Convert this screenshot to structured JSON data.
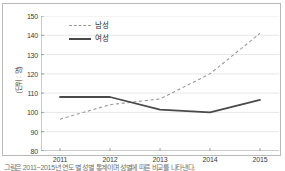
{
  "chart_data": {
    "type": "line",
    "title": "",
    "xlabel": "",
    "ylabel": "(단위 : 명)",
    "categories": [
      "2011",
      "2012",
      "2013",
      "2014",
      "2015"
    ],
    "ylim": [
      80,
      150
    ],
    "yticks": [
      80,
      90,
      100,
      110,
      120,
      130,
      140,
      150
    ],
    "grid": true,
    "legend_position": "top-left",
    "series": [
      {
        "name": "남성",
        "style": "dashed",
        "color": "#9a9a9a",
        "values": [
          96.5,
          104,
          107,
          120,
          141
        ]
      },
      {
        "name": "여성",
        "style": "solid",
        "color": "#4a4a4a",
        "values": [
          108,
          108,
          101.5,
          100,
          106.5
        ]
      }
    ]
  },
  "axis": {
    "y_title": "(단위 : 명)",
    "y_tick_labels": [
      "150",
      "140",
      "130",
      "120",
      "110",
      "100",
      "90",
      "80"
    ],
    "x_tick_labels": [
      "2011",
      "2012",
      "2013",
      "2014",
      "2015"
    ]
  },
  "legend": {
    "items": [
      {
        "label": "남성",
        "swatch": "dashed-line-swatch"
      },
      {
        "label": "여성",
        "swatch": "solid-line-swatch"
      }
    ]
  },
  "caption": {
    "text": "그림은 2011~2015년 연도 별 성별 통계이며 성별에 따른 비교를 나타낸다."
  },
  "colors": {
    "male_line": "#9a9a9a",
    "female_line": "#4a4a4a",
    "grid": "#dcdcdc",
    "axis": "#8c8c8c",
    "frame": "#b9b9b9"
  }
}
